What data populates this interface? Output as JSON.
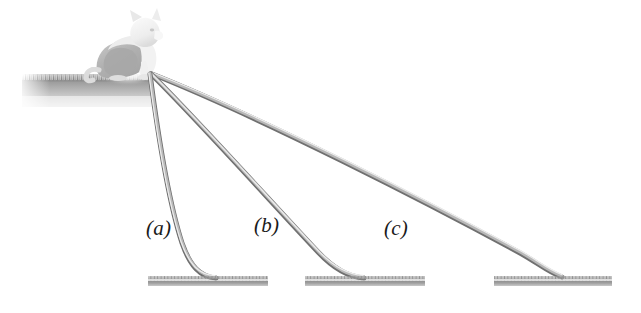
{
  "figure": {
    "background_color": "#ffffff",
    "width": 641,
    "height": 313
  },
  "ledge": {
    "name": "grassy-ledge",
    "description": "Grass-topped ledge platform on the left",
    "x": 22,
    "y": 74,
    "width": 130,
    "height": 33,
    "grass_color": "#8f8f8f",
    "fill_top_color": "#9c9c9c",
    "fill_bottom_color": "#dcdcdc"
  },
  "cat": {
    "name": "cat",
    "description": "Light grey cat sitting at the ledge edge facing right",
    "body_color": "#b6b6b6",
    "outline_color": "#cfcfcf",
    "x": 95,
    "y": 8,
    "width": 70,
    "height": 68
  },
  "pivot": {
    "x": 150,
    "y": 74,
    "description": "Common top anchor point where all three slides meet"
  },
  "ramps": [
    {
      "id": "a",
      "label": "(a)",
      "label_x": 146,
      "label_y": 216,
      "steepness": "steepest",
      "top_x": 150,
      "top_y": 74,
      "bottom_x": 216,
      "bottom_y": 278,
      "highlight_color": "#e3e3e3",
      "shade_color": "#6f6f6f"
    },
    {
      "id": "b",
      "label": "(b)",
      "label_x": 254,
      "label_y": 213,
      "steepness": "intermediate",
      "top_x": 151,
      "top_y": 74,
      "bottom_x": 364,
      "bottom_y": 278,
      "highlight_color": "#e3e3e3",
      "shade_color": "#6f6f6f"
    },
    {
      "id": "c",
      "label": "(c)",
      "label_x": 384,
      "label_y": 216,
      "steepness": "shallowest",
      "top_x": 152,
      "top_y": 73,
      "bottom_x": 562,
      "bottom_y": 278,
      "highlight_color": "#e3e3e3",
      "shade_color": "#6f6f6f"
    }
  ],
  "landing_pads": [
    {
      "id": "pad-a",
      "x": 148,
      "y": 276,
      "width": 120,
      "height": 9,
      "color": "#9a9a9a"
    },
    {
      "id": "pad-b",
      "x": 305,
      "y": 276,
      "width": 120,
      "height": 9,
      "color": "#9a9a9a"
    },
    {
      "id": "pad-c",
      "x": 494,
      "y": 276,
      "width": 118,
      "height": 9,
      "color": "#9a9a9a"
    }
  ],
  "colors": {
    "ink": "#1a1a1a",
    "grey_dark": "#6f6f6f",
    "grey_mid": "#9a9a9a",
    "grey_light": "#d4d4d4",
    "white": "#ffffff"
  }
}
